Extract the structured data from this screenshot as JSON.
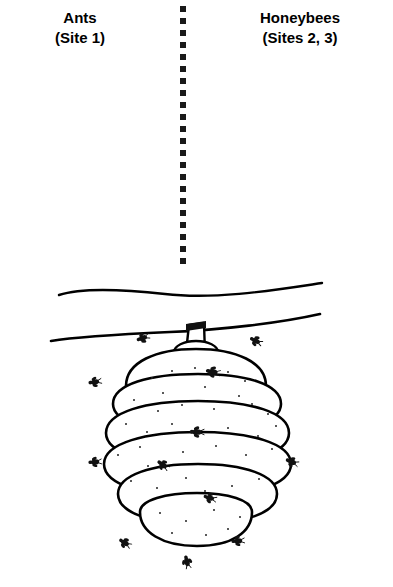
{
  "figure": {
    "kind": "line-drawing-illustration",
    "background_color": "#ffffff",
    "ink_color": "#000000"
  },
  "labels": {
    "left": {
      "name": "Ants",
      "sites": "(Site 1)"
    },
    "right": {
      "name": "Honeybees",
      "sites": "(Sites 2, 3)"
    }
  },
  "divider": {
    "style": "dotted",
    "orientation": "vertical",
    "dot_color": "#1a1a1a",
    "dot_size": 6,
    "dot_spacing": 12,
    "dot_count": 22,
    "x": 180,
    "y_start": 6,
    "y_end": 272
  },
  "illustration": {
    "branch": {
      "label": "tree-branch",
      "x_start": 58,
      "x_end": 322,
      "y": 300
    },
    "stem": {
      "label": "hive-stem",
      "x": 196,
      "y_top": 322,
      "y_bottom": 348
    },
    "hive": {
      "label": "beehive",
      "center_x": 196,
      "top": 345,
      "bottom": 545,
      "width": 190,
      "layers": 6,
      "texture": "speckled dots"
    },
    "bees": [
      {
        "x": 143,
        "y": 338,
        "rot": -20,
        "scale": 1.0
      },
      {
        "x": 256,
        "y": 341,
        "rot": 25,
        "scale": 1.0
      },
      {
        "x": 213,
        "y": 372,
        "rot": 10,
        "scale": 1.1
      },
      {
        "x": 95,
        "y": 382,
        "rot": -10,
        "scale": 1.0
      },
      {
        "x": 197,
        "y": 432,
        "rot": 0,
        "scale": 1.1
      },
      {
        "x": 95,
        "y": 462,
        "rot": -5,
        "scale": 1.0
      },
      {
        "x": 163,
        "y": 465,
        "rot": 35,
        "scale": 1.0
      },
      {
        "x": 292,
        "y": 462,
        "rot": 20,
        "scale": 1.0
      },
      {
        "x": 210,
        "y": 498,
        "rot": 15,
        "scale": 1.0
      },
      {
        "x": 125,
        "y": 543,
        "rot": 30,
        "scale": 1.0
      },
      {
        "x": 238,
        "y": 541,
        "rot": -5,
        "scale": 1.0
      },
      {
        "x": 187,
        "y": 562,
        "rot": 75,
        "scale": 1.0
      }
    ]
  }
}
